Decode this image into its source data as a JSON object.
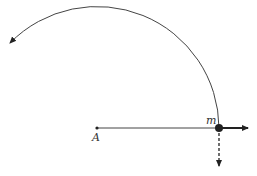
{
  "diagram": {
    "type": "circular motion",
    "labels": {
      "center": "A",
      "mass": "m"
    },
    "colors": {
      "stroke": "#333333",
      "background": "#ffffff"
    },
    "geometry": {
      "center": [
        97,
        128
      ],
      "radius": 122,
      "mass_point": [
        219,
        128
      ]
    }
  }
}
